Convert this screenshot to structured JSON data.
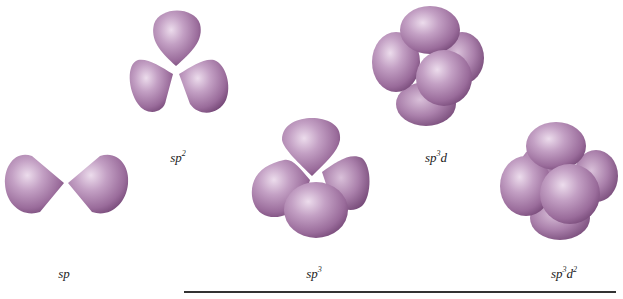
{
  "figure": {
    "type": "hybrid-orbital-geometries",
    "colors": {
      "lobe_highlight": "#e6d3e6",
      "lobe_mid": "#b28ab3",
      "lobe_shadow": "#7d4f7f",
      "rule": "#333333",
      "label": "#222222"
    },
    "hybrids": [
      {
        "id": "sp",
        "base": "sp",
        "sup1": "",
        "mid": "",
        "sup2": "",
        "lobes": 2
      },
      {
        "id": "sp2",
        "base": "sp",
        "sup1": "2",
        "mid": "",
        "sup2": "",
        "lobes": 3
      },
      {
        "id": "sp3",
        "base": "sp",
        "sup1": "3",
        "mid": "",
        "sup2": "",
        "lobes": 4
      },
      {
        "id": "sp3d",
        "base": "sp",
        "sup1": "3",
        "mid": "d",
        "sup2": "",
        "lobes": 5
      },
      {
        "id": "sp3d2",
        "base": "sp",
        "sup1": "3",
        "mid": "d",
        "sup2": "2",
        "lobes": 6
      }
    ]
  }
}
